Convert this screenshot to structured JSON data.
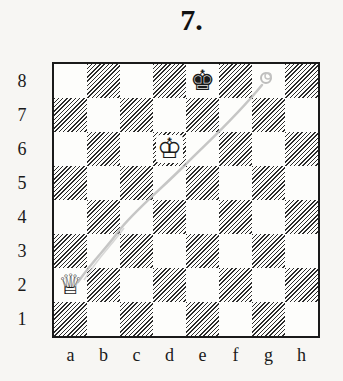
{
  "diagram": {
    "number_label": "7.",
    "ranks": [
      "8",
      "7",
      "6",
      "5",
      "4",
      "3",
      "2",
      "1"
    ],
    "files": [
      "a",
      "b",
      "c",
      "d",
      "e",
      "f",
      "g",
      "h"
    ],
    "pieces": [
      {
        "square": "e8",
        "color": "black",
        "type": "king",
        "glyph": "♚"
      },
      {
        "square": "d6",
        "color": "white",
        "type": "king",
        "glyph": "♔"
      },
      {
        "square": "a2",
        "color": "white",
        "type": "queen",
        "glyph": "♕"
      }
    ],
    "annotation": {
      "type": "pencil-line",
      "from": "a2",
      "to": "g8",
      "color": "#b5b5b5"
    },
    "colors": {
      "dark_square_hatch": "#2b2b2b",
      "light_square": "#fdfdfb",
      "border": "#1a1a1a"
    }
  }
}
